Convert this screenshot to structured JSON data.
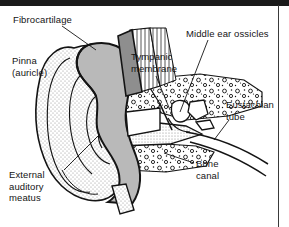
{
  "figure": {
    "kind": "anatomical-diagram",
    "width": 289,
    "height": 227,
    "background_color": "#ffffff",
    "ink_color": "#141414"
  },
  "frame": {
    "top_bar_color": "#1a1a1a",
    "right_rule_color": "#3a3a3a"
  },
  "labels": [
    {
      "id": "fibrocartilage",
      "text": "Fibrocartilage",
      "x": 13,
      "y": 14
    },
    {
      "id": "pinna",
      "text": "Pinna\n(auricle)",
      "x": 12,
      "y": 55
    },
    {
      "id": "tympanic",
      "text": "Tympanic\nmembrane",
      "x": 131,
      "y": 51
    },
    {
      "id": "ossicles",
      "text": "Middle ear ossicles",
      "x": 186,
      "y": 28
    },
    {
      "id": "eustachian",
      "text": "Eustachian\ntube",
      "x": 226,
      "y": 99
    },
    {
      "id": "bone-canal",
      "text": "Bone\ncanal",
      "x": 196,
      "y": 158
    },
    {
      "id": "external-meatus",
      "text": "External\nauditory\nmeatus",
      "x": 9,
      "y": 169
    }
  ],
  "leader_lines": [
    {
      "id": "leader-fibrocartilage",
      "from": [
        62,
        26
      ],
      "to": [
        92,
        48
      ]
    },
    {
      "id": "leader-tympanic",
      "from": [
        156,
        76
      ],
      "to": [
        172,
        105
      ]
    },
    {
      "id": "leader-ossicles",
      "from": [
        205,
        40
      ],
      "to": [
        180,
        112
      ]
    },
    {
      "id": "leader-eustachian",
      "from": [
        228,
        119
      ],
      "to": [
        214,
        138
      ]
    },
    {
      "id": "leader-bone-canal",
      "from": [
        194,
        163
      ],
      "to": [
        166,
        154
      ]
    },
    {
      "id": "leader-external-meatus",
      "from": [
        62,
        170
      ],
      "to": [
        98,
        136
      ]
    }
  ],
  "anatomy_parts": [
    {
      "id": "pinna-auricle",
      "name": "Pinna (auricle)",
      "texture": "stipple"
    },
    {
      "id": "fibrocartilage-band",
      "name": "Fibrocartilage",
      "texture": "hatch"
    },
    {
      "id": "temporal-bone",
      "name": "Temporal bone",
      "texture": "cancellous"
    },
    {
      "id": "tympanic-membrane",
      "name": "Tympanic membrane",
      "texture": "line"
    },
    {
      "id": "ossicle-malleus",
      "name": "Malleus",
      "texture": "outline"
    },
    {
      "id": "ossicle-incus",
      "name": "Incus",
      "texture": "outline"
    },
    {
      "id": "ossicle-stapes",
      "name": "Stapes",
      "texture": "outline"
    },
    {
      "id": "eustachian-tube",
      "name": "Eustachian tube",
      "texture": "line"
    },
    {
      "id": "bone-canal",
      "name": "Bone canal",
      "texture": "cancellous"
    },
    {
      "id": "external-auditory-meatus",
      "name": "External auditory meatus",
      "texture": "stipple"
    }
  ]
}
